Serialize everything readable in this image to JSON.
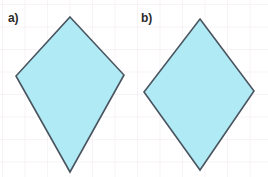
{
  "figure": {
    "width": 268,
    "height": 177,
    "background_color": "#ffffff"
  },
  "grid": {
    "visible": true,
    "spacing": 22.5,
    "line_color": "#f0e6ee",
    "line_width": 1,
    "origin_x": 2,
    "origin_y": 4
  },
  "style": {
    "fill_color": "#b0ebf5",
    "fill_opacity": 1,
    "stroke_color": "#4a5560",
    "stroke_width": 1.6,
    "label_color": "#2b2b2b"
  },
  "shapes": [
    {
      "id": "shape-a",
      "label": "a)",
      "name": "kite",
      "label_x": 8,
      "label_y": 12,
      "points": "70,17 124,75 70,172 16,76",
      "vertices": [
        {
          "name": "top",
          "x": 70,
          "y": 17
        },
        {
          "name": "right",
          "x": 124,
          "y": 75
        },
        {
          "name": "bottom",
          "x": 70,
          "y": 172
        },
        {
          "name": "left",
          "x": 16,
          "y": 76
        }
      ]
    },
    {
      "id": "shape-b",
      "label": "b)",
      "name": "rhombus",
      "label_x": 141,
      "label_y": 12,
      "points": "200,19 254,91 200,170 144,92",
      "vertices": [
        {
          "name": "top",
          "x": 200,
          "y": 19
        },
        {
          "name": "right",
          "x": 254,
          "y": 91
        },
        {
          "name": "bottom",
          "x": 200,
          "y": 170
        },
        {
          "name": "left",
          "x": 144,
          "y": 92
        }
      ]
    }
  ]
}
